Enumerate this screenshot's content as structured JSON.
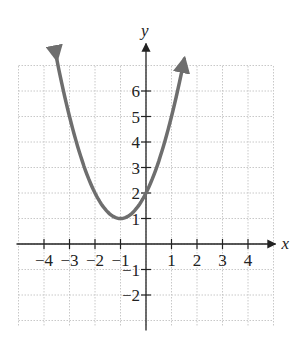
{
  "chart_data": {
    "type": "line",
    "title": "",
    "xlabel": "x",
    "ylabel": "y",
    "xlim": [
      -5,
      5
    ],
    "ylim": [
      -3,
      7
    ],
    "grid": true,
    "x_ticks": [
      "-4",
      "-3",
      "-2",
      "-1",
      "1",
      "2",
      "3",
      "4"
    ],
    "y_ticks": [
      "-2",
      "-1",
      "1",
      "2",
      "3",
      "4",
      "5",
      "6"
    ],
    "series": [
      {
        "name": "y = (x+1)^2 + 1",
        "color": "#6e6e6e",
        "x": [
          -3.5,
          -3,
          -2.5,
          -2,
          -1.5,
          -1,
          -0.5,
          0,
          0.5,
          1,
          1.5
        ],
        "y": [
          7.25,
          5,
          3.25,
          2,
          1.25,
          1,
          1.25,
          2,
          3.25,
          5,
          7.25
        ],
        "arrows_both_ends": true
      }
    ],
    "vertex": [
      -1,
      1
    ],
    "y_intercept": [
      0,
      2
    ]
  }
}
